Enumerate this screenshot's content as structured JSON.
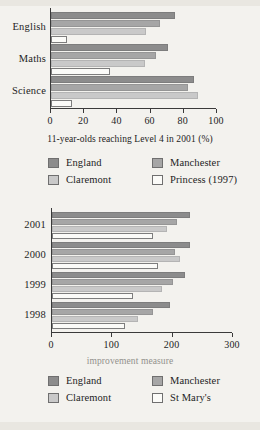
{
  "colors": {
    "england": "#8c8c8c",
    "manchester": "#a6a6a6",
    "claremont": "#c9c9c9",
    "fourth": "#fbfbf8",
    "axis": "#3a3a3a",
    "background": "#f3f2ee",
    "text": "#1d1d1d"
  },
  "chart_data": [
    {
      "type": "bar",
      "orientation": "horizontal",
      "title": "",
      "xlabel": "11-year-olds reaching Level 4 in 2001 (%)",
      "ylabel": "",
      "xlim": [
        0,
        100
      ],
      "xticks": [
        0,
        20,
        40,
        60,
        80,
        100
      ],
      "xtick_labels": [
        "0",
        "20",
        "40",
        "60",
        "80",
        "100"
      ],
      "grid": false,
      "legend_position": "bottom",
      "categories": [
        "English",
        "Maths",
        "Science"
      ],
      "series": [
        {
          "name": "England",
          "values": [
            75,
            71,
            87
          ]
        },
        {
          "name": "Manchester",
          "values": [
            66,
            64,
            83
          ]
        },
        {
          "name": "Claremont",
          "values": [
            58,
            57,
            89
          ]
        },
        {
          "name": "Princess (1997)",
          "values": [
            10,
            36,
            13
          ]
        }
      ]
    },
    {
      "type": "bar",
      "orientation": "horizontal",
      "title": "",
      "xlabel": "improvement measure",
      "ylabel": "",
      "xlim": [
        0,
        300
      ],
      "xticks": [
        0,
        100,
        200,
        300
      ],
      "xtick_labels": [
        "0",
        "100",
        "200",
        "300"
      ],
      "grid": false,
      "legend_position": "bottom",
      "categories": [
        "2001",
        "2000",
        "1999",
        "1998"
      ],
      "series": [
        {
          "name": "England",
          "values": [
            230,
            230,
            222,
            197
          ]
        },
        {
          "name": "Manchester",
          "values": [
            209,
            205,
            202,
            169
          ]
        },
        {
          "name": "Claremont",
          "values": [
            192,
            213,
            184,
            144
          ]
        },
        {
          "name": "St Mary's",
          "values": [
            169,
            177,
            136,
            122
          ]
        }
      ]
    }
  ],
  "chart_one": {
    "axis_label": "11-year-olds reaching Level 4 in 2001 (%)",
    "category_labels": [
      "English",
      "Maths",
      "Science"
    ],
    "tick_labels": [
      "0",
      "20",
      "40",
      "60",
      "80",
      "100"
    ],
    "legend": [
      {
        "label": "England",
        "color": "#8c8c8c"
      },
      {
        "label": "Manchester",
        "color": "#a6a6a6"
      },
      {
        "label": "Claremont",
        "color": "#c9c9c9"
      },
      {
        "label": "Princess (1997)",
        "color": "#fbfbf8"
      }
    ]
  },
  "chart_two": {
    "axis_label": "improvement measure",
    "category_labels": [
      "2001",
      "2000",
      "1999",
      "1998"
    ],
    "tick_labels": [
      "0",
      "100",
      "200",
      "300"
    ],
    "legend": [
      {
        "label": "England",
        "color": "#8c8c8c"
      },
      {
        "label": "Manchester",
        "color": "#a6a6a6"
      },
      {
        "label": "Claremont",
        "color": "#c9c9c9"
      },
      {
        "label": "St Mary's",
        "color": "#fbfbf8"
      }
    ]
  }
}
